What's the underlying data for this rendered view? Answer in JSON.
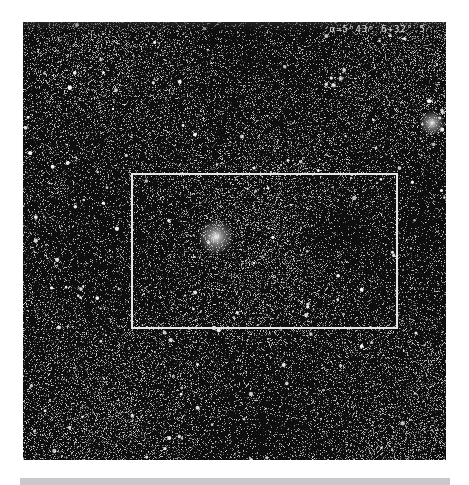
{
  "plate": {
    "description": "Photographic star field plate with inset rectangle",
    "coord_label": "α=5ʰ43ᵐ δ+32°.5",
    "background_color": "#0d0d0d",
    "frame": {
      "x": 23,
      "y": 22,
      "width": 423,
      "height": 438
    },
    "inset_box": {
      "x": 131,
      "y": 173,
      "width": 267,
      "height": 156,
      "color": "#e6e6e6"
    },
    "clusters": [
      {
        "name": "central-cluster",
        "x": 216,
        "y": 237,
        "radius": 10
      },
      {
        "name": "edge-cluster",
        "x": 432,
        "y": 123,
        "radius": 7
      }
    ],
    "dark_patch": {
      "x": 340,
      "y": 230,
      "radius": 22
    }
  },
  "bottom_band": {
    "color": "#c9c9c9"
  }
}
